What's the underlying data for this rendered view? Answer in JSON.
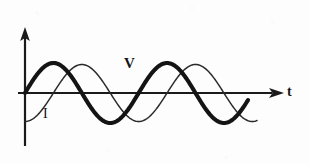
{
  "figure": {
    "background_color": "#fdfdfd",
    "ink_color": "#141414",
    "width": 310,
    "height": 164
  },
  "labels": {
    "voltage": "V",
    "current": "I",
    "time_axis": "t"
  },
  "axes": {
    "vertical_axis_name": "amplitude-axis",
    "horizontal_axis_name": "time-axis",
    "origin_x": 25,
    "baseline_y": 93,
    "vertical_top_y": 27,
    "vertical_bottom_y": 146,
    "horizontal_end_x": 284,
    "arrow_color": "#1a1a1a"
  },
  "chart_data": {
    "type": "line",
    "xlabel": "t",
    "ylabel": "",
    "grid": false,
    "legend": "inline-annotations",
    "xlim": [
      0,
      2.05
    ],
    "ylim": [
      -1.15,
      1.15
    ],
    "x_unit": "periods",
    "series": [
      {
        "name": "V",
        "label": "V",
        "style": "thick",
        "stroke_width": 4.1,
        "color": "#141414",
        "amplitude": 1.0,
        "period": 1.0,
        "phase_deg": 0,
        "equation": "V = A sin(2πt)",
        "x": [
          0,
          0.125,
          0.25,
          0.375,
          0.5,
          0.625,
          0.75,
          0.875,
          1.0,
          1.125,
          1.25,
          1.375,
          1.5,
          1.625,
          1.75,
          1.875,
          2.0
        ],
        "values": [
          0,
          0.707,
          1.0,
          0.707,
          0,
          -0.707,
          -1.0,
          -0.707,
          0,
          0.707,
          1.0,
          0.707,
          0,
          -0.707,
          -1.0,
          -0.707,
          0
        ]
      },
      {
        "name": "I",
        "label": "I",
        "style": "thin",
        "stroke_width": 1.5,
        "color": "#2a2a2a",
        "amplitude": 0.95,
        "period": 1.0,
        "phase_deg": -90,
        "phase_relationship": "current lags voltage by 90 degrees",
        "equation": "I = A sin(2πt − π/2)",
        "x": [
          0,
          0.125,
          0.25,
          0.375,
          0.5,
          0.625,
          0.75,
          0.875,
          1.0,
          1.125,
          1.25,
          1.375,
          1.5,
          1.625,
          1.75,
          1.875,
          2.0,
          2.05
        ],
        "values": [
          -0.95,
          -0.672,
          0,
          0.672,
          0.95,
          0.672,
          0,
          -0.672,
          -0.95,
          -0.672,
          0,
          0.672,
          0.95,
          0.672,
          0,
          -0.672,
          -0.95,
          -0.9
        ]
      }
    ],
    "annotations": [
      {
        "text": "V",
        "x_px": 130,
        "y_px": 64,
        "series": "V"
      },
      {
        "text": "I",
        "x_px": 47,
        "y_px": 114,
        "series": "I"
      },
      {
        "text": "t",
        "x_px": 290,
        "y_px": 92,
        "role": "axis-label"
      }
    ]
  }
}
